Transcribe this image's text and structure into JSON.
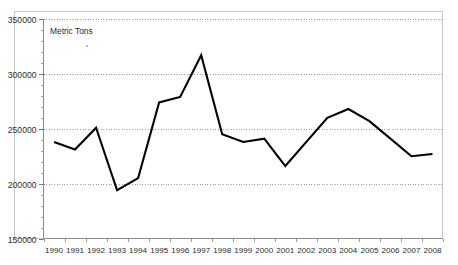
{
  "chart_data": {
    "type": "line",
    "title": "",
    "subtitle": "",
    "xlabel": "",
    "ylabel": "",
    "series_label": "Metric Tons",
    "categories": [
      "1990",
      "1991",
      "1992",
      "1993",
      "1994",
      "1995",
      "1996",
      "1997",
      "1998",
      "1999",
      "2000",
      "2001",
      "2002",
      "2003",
      "2004",
      "2005",
      "2006",
      "2007",
      "2008"
    ],
    "values": [
      238000,
      231000,
      251000,
      194000,
      205000,
      274000,
      279000,
      317000,
      245000,
      238000,
      241000,
      216000,
      238000,
      260000,
      268000,
      257000,
      241000,
      225000,
      227000
    ],
    "series": [
      {
        "name": "Metric Tons",
        "values": [
          238000,
          231000,
          251000,
          194000,
          205000,
          274000,
          279000,
          317000,
          245000,
          238000,
          241000,
          216000,
          238000,
          260000,
          268000,
          257000,
          241000,
          225000,
          227000
        ]
      }
    ],
    "ylim": [
      150000,
      350000
    ],
    "yticks": [
      150000,
      200000,
      250000,
      300000,
      350000
    ],
    "ytick_labels": [
      "150000",
      "200000",
      "250000",
      "300000",
      "350000"
    ],
    "y_minor_tick_step": 10000,
    "xtick_labels": [
      "1990",
      "1991",
      "1992",
      "1993",
      "1994",
      "1995",
      "1996",
      "1997",
      "1998",
      "1999",
      "2000",
      "2001",
      "2002",
      "2003",
      "2004",
      "2005",
      "2006",
      "2007",
      "2008"
    ],
    "grid": true,
    "grid_axis": "y",
    "legend": "none",
    "legend_position": "none",
    "line_color": "#000000",
    "grid_color": "#9b9b9b",
    "axis_color": "#8a8a8a",
    "frame_color": "#c9c9c9",
    "background_color": "#ffffff",
    "annotations": []
  }
}
